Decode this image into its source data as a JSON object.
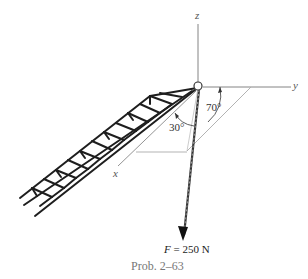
{
  "figure": {
    "caption": "Prob. 2–63",
    "axes": {
      "x_label": "x",
      "y_label": "y",
      "z_label": "z"
    },
    "angles": [
      {
        "id": "angle-70",
        "label": "70°",
        "between": "force projection and y-axis"
      },
      {
        "id": "angle-30",
        "label": "30°",
        "between": "force and its projection in x-y plane"
      }
    ],
    "force": {
      "symbol": "F",
      "equals": " = 250 N",
      "magnitude": 250,
      "unit": "N"
    },
    "elements": [
      "truss boom",
      "pin joint at origin",
      "cable with force F"
    ],
    "colors": {
      "lines": "#222222",
      "projection": "#999999",
      "axis": "#777777"
    }
  }
}
